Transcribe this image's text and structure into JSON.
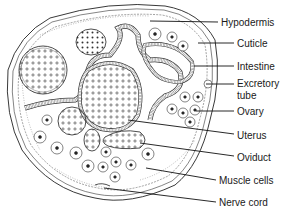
{
  "diagram": {
    "labels": [
      {
        "id": "hypodermis",
        "text": "Hypodermis",
        "x": 221,
        "y": 17,
        "line": {
          "x1": 150,
          "y1": 21,
          "x2": 218,
          "y2": 22
        }
      },
      {
        "id": "cuticle",
        "text": "Cuticle",
        "x": 237,
        "y": 38,
        "line": {
          "x1": 198,
          "y1": 43,
          "x2": 234,
          "y2": 43
        }
      },
      {
        "id": "intestine",
        "text": "Intestine",
        "x": 237,
        "y": 61,
        "line": {
          "x1": 194,
          "y1": 66,
          "x2": 234,
          "y2": 66
        }
      },
      {
        "id": "excretory-tube",
        "text": "Excretory",
        "text2": "tube",
        "x": 237,
        "y": 78,
        "line": {
          "x1": 206,
          "y1": 84,
          "x2": 234,
          "y2": 84
        }
      },
      {
        "id": "ovary",
        "text": "Ovary",
        "x": 237,
        "y": 106,
        "line": {
          "x1": 196,
          "y1": 111,
          "x2": 234,
          "y2": 111
        }
      },
      {
        "id": "uterus",
        "text": "Uterus",
        "x": 237,
        "y": 130,
        "line": {
          "x1": 128,
          "y1": 120,
          "x2": 234,
          "y2": 134
        }
      },
      {
        "id": "oviduct",
        "text": "Oviduct",
        "x": 237,
        "y": 152,
        "line": {
          "x1": 140,
          "y1": 143,
          "x2": 234,
          "y2": 156
        }
      },
      {
        "id": "muscle-cells",
        "text": "Muscle cells",
        "x": 219,
        "y": 175,
        "line": {
          "x1": 146,
          "y1": 168,
          "x2": 216,
          "y2": 180
        }
      },
      {
        "id": "nerve-cord",
        "text": "Nerve cord",
        "x": 219,
        "y": 197,
        "line": {
          "x1": 104,
          "y1": 188,
          "x2": 216,
          "y2": 202
        }
      }
    ],
    "colors": {
      "ink": "#1a1a1a",
      "background": "#ffffff"
    }
  }
}
